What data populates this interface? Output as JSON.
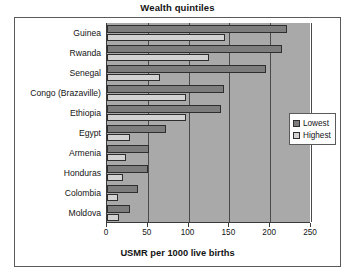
{
  "chart_data": {
    "type": "bar",
    "orientation": "horizontal",
    "title": "Wealth quintiles",
    "xlabel": "USMR per 1000 live births",
    "ylabel": "",
    "xlim": [
      0,
      250
    ],
    "xticks": [
      0,
      50,
      100,
      150,
      200,
      250
    ],
    "grid": true,
    "legend_position": "right",
    "categories": [
      "Guinea",
      "Rwanda",
      "Senegal",
      "Congo (Brazaville)",
      "Ethiopia",
      "Egypt",
      "Armenia",
      "Honduras",
      "Colombia",
      "Moldova"
    ],
    "series": [
      {
        "name": "Lowest",
        "color": "#7d7d7d",
        "values": [
          220,
          215,
          195,
          143,
          140,
          72,
          52,
          50,
          38,
          28
        ]
      },
      {
        "name": "Highest",
        "color": "#d2d2d2",
        "values": [
          145,
          125,
          65,
          97,
          97,
          28,
          23,
          19,
          13,
          15
        ]
      }
    ]
  },
  "legend": {
    "items": [
      {
        "label": "Lowest"
      },
      {
        "label": "Highest"
      }
    ]
  },
  "colors": {
    "plot_background": "#a9a9a9",
    "gridline": "#4a4a4a",
    "axis": "#3a3a3a",
    "frame": "#5a5a5a",
    "lowest": "#7d7d7d",
    "highest": "#d2d2d2"
  }
}
